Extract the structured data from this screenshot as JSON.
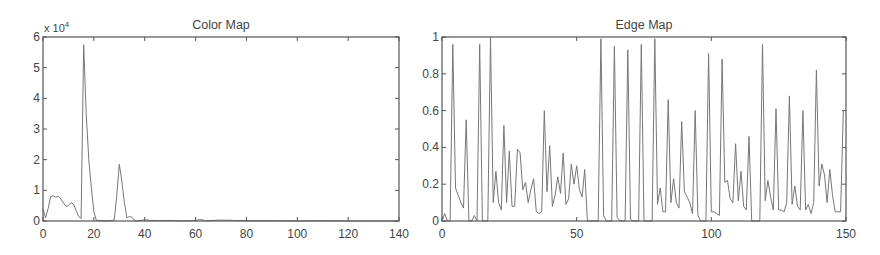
{
  "chart_data": [
    {
      "type": "line",
      "title": "Color Map",
      "xlabel": "",
      "ylabel": "",
      "y_multiplier_label": "x 10^4",
      "xlim": [
        0,
        140
      ],
      "ylim": [
        0,
        6
      ],
      "xticks": [
        0,
        20,
        40,
        60,
        80,
        100,
        120,
        140
      ],
      "yticks": [
        0,
        1,
        2,
        3,
        4,
        5,
        6
      ],
      "grid": false,
      "box": {
        "left": 43,
        "top": 37,
        "right": 399,
        "bottom": 221
      },
      "series": [
        {
          "name": "color-histogram",
          "x": [
            0,
            1,
            2,
            3,
            4,
            5,
            6,
            7,
            8,
            9,
            10,
            11,
            12,
            13,
            14,
            15,
            16,
            17,
            18,
            19,
            20,
            21,
            22,
            24,
            26,
            28,
            29,
            30,
            31,
            32,
            33,
            34,
            35,
            36,
            37,
            38,
            40,
            42,
            45,
            50,
            55,
            60,
            62,
            64,
            70,
            80,
            90,
            100,
            110,
            120,
            130,
            140
          ],
          "values": [
            0.4,
            0.1,
            0.4,
            0.8,
            0.82,
            0.78,
            0.8,
            0.72,
            0.6,
            0.48,
            0.5,
            0.6,
            0.55,
            0.35,
            0.15,
            0.08,
            5.75,
            3.5,
            2.0,
            1.1,
            0.3,
            0.02,
            0.02,
            0.0,
            0.01,
            0.03,
            0.8,
            1.85,
            1.3,
            0.6,
            0.1,
            0.15,
            0.12,
            0.02,
            0.0,
            0.01,
            0.04,
            0.02,
            0.01,
            0.02,
            0.0,
            0.02,
            0.05,
            0.01,
            0.03,
            0.01,
            0.01,
            0.0,
            0.01,
            0.0,
            0.0,
            0.0
          ]
        }
      ]
    },
    {
      "type": "line",
      "title": "Edge Map",
      "xlabel": "",
      "ylabel": "",
      "xlim": [
        0,
        150
      ],
      "ylim": [
        0,
        1
      ],
      "xticks": [
        0,
        50,
        100,
        150
      ],
      "yticks": [
        0,
        0.2,
        0.4,
        0.6,
        0.8,
        1
      ],
      "grid": false,
      "box": {
        "left": 442,
        "top": 37,
        "right": 846,
        "bottom": 221
      },
      "series": [
        {
          "name": "edge-histogram",
          "x": [
            0,
            1,
            2,
            3,
            4,
            5,
            6,
            7,
            8,
            9,
            10,
            11,
            12,
            13,
            14,
            15,
            16,
            17,
            18,
            19,
            20,
            21,
            22,
            23,
            24,
            25,
            26,
            27,
            28,
            29,
            30,
            31,
            32,
            33,
            34,
            35,
            36,
            37,
            38,
            39,
            40,
            41,
            42,
            43,
            44,
            45,
            46,
            47,
            48,
            49,
            50,
            51,
            52,
            53,
            54,
            55,
            56,
            57,
            58,
            59,
            60,
            61,
            62,
            63,
            64,
            65,
            66,
            67,
            68,
            69,
            70,
            71,
            72,
            73,
            74,
            75,
            76,
            77,
            78,
            79,
            80,
            81,
            82,
            83,
            84,
            85,
            86,
            87,
            88,
            89,
            90,
            91,
            92,
            93,
            94,
            95,
            96,
            97,
            98,
            99,
            100,
            101,
            102,
            103,
            104,
            105,
            106,
            107,
            108,
            109,
            110,
            111,
            112,
            113,
            114,
            115,
            116,
            117,
            118,
            119,
            120,
            121,
            122,
            123,
            124,
            125,
            126,
            127,
            128,
            129,
            130,
            131,
            132,
            133,
            134,
            135,
            136,
            137,
            138,
            139,
            140,
            141,
            142,
            143,
            144,
            145,
            146,
            147,
            148,
            149,
            150
          ],
          "values": [
            0.0,
            0.04,
            0.0,
            0.0,
            0.96,
            0.18,
            0.14,
            0.1,
            0.07,
            0.55,
            0.0,
            0.0,
            0.03,
            0.0,
            0.96,
            0.0,
            0.0,
            0.0,
            1.0,
            0.1,
            0.27,
            0.1,
            0.06,
            0.52,
            0.1,
            0.38,
            0.08,
            0.08,
            0.39,
            0.37,
            0.17,
            0.21,
            0.1,
            0.17,
            0.23,
            0.05,
            0.04,
            0.05,
            0.6,
            0.16,
            0.41,
            0.08,
            0.14,
            0.24,
            0.15,
            0.37,
            0.09,
            0.12,
            0.31,
            0.2,
            0.3,
            0.17,
            0.13,
            0.28,
            0.0,
            0.0,
            0.0,
            0.0,
            0.0,
            0.99,
            0.03,
            0.0,
            0.0,
            0.0,
            0.95,
            0.02,
            0.0,
            0.0,
            0.0,
            0.93,
            0.01,
            0.0,
            0.0,
            0.0,
            0.96,
            0.0,
            0.0,
            0.0,
            0.0,
            0.99,
            0.09,
            0.18,
            0.05,
            0.05,
            0.66,
            0.1,
            0.23,
            0.1,
            0.07,
            0.54,
            0.16,
            0.13,
            0.1,
            0.04,
            0.6,
            0.03,
            0.0,
            0.0,
            0.0,
            0.91,
            0.05,
            0.05,
            0.04,
            0.03,
            0.88,
            0.21,
            0.22,
            0.12,
            0.1,
            0.42,
            0.11,
            0.27,
            0.08,
            0.06,
            0.46,
            0.0,
            0.0,
            0.0,
            0.0,
            0.96,
            0.11,
            0.22,
            0.13,
            0.06,
            0.61,
            0.06,
            0.06,
            0.05,
            0.1,
            0.68,
            0.09,
            0.19,
            0.08,
            0.06,
            0.6,
            0.06,
            0.09,
            0.04,
            0.1,
            0.82,
            0.19,
            0.31,
            0.25,
            0.1,
            0.28,
            0.14,
            0.05,
            0.05,
            0.05,
            0.6
          ]
        }
      ]
    }
  ],
  "labels": {
    "left_title": "Color Map",
    "right_title": "Edge Map",
    "left_multiplier_base": "x 10",
    "left_multiplier_exp": "4"
  },
  "colors": {
    "frame": "#555555",
    "line": "#777777",
    "text": "#444444"
  }
}
